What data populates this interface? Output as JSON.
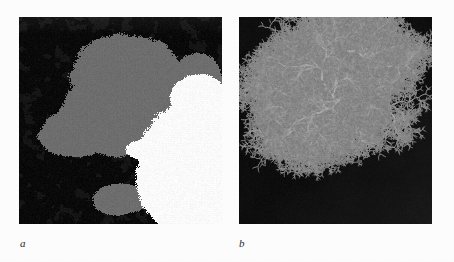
{
  "figure": {
    "type": "two-panel-scientific-figure",
    "background_color": "#fdfdfd",
    "panels": [
      {
        "id": "a",
        "label": "a",
        "name": "percolation-cluster-panel",
        "x": 19,
        "y": 17,
        "width": 203,
        "height": 207,
        "description": "Large irregular percolation / invasion cluster rendered in three tones: black background matrix, mid-grey occupied cluster, white invading region at lower right",
        "colors": {
          "background": "#0a0a0a",
          "cluster": "#6e6e6e",
          "void": "#fbfbfb",
          "dark_noise": "#161616"
        },
        "seed": 20394,
        "grid": 128,
        "occupancy": 0.5,
        "white_region_center": [
          0.82,
          0.72
        ],
        "white_region_radius": 0.34
      },
      {
        "id": "b",
        "label": "b",
        "name": "dla-dendrite-panel",
        "x": 239,
        "y": 17,
        "width": 193,
        "height": 207,
        "description": "Diffusion-limited-aggregation dendritic fractal, light grey branches on a near-black field, cluster occupying the upper-middle of the frame",
        "colors": {
          "background": "#070707",
          "branches": "#9a9a9a",
          "branch_tip": "#b8b8b8",
          "dark_noise": "#121212"
        },
        "seed": 77431,
        "cluster_center": [
          0.52,
          0.4
        ],
        "cluster_extent": 0.46,
        "branch_count": 7,
        "branch_depth": 7,
        "scale_marker": {
          "present": true,
          "x": 0.61,
          "y": 0.69,
          "width_px": 5,
          "height_px": 3,
          "color": "#5a5a5a"
        }
      }
    ]
  },
  "chart_data": {
    "type": "image",
    "title": "",
    "subtitle": "",
    "xlabel": "",
    "ylabel": "",
    "legend": [],
    "annotations": [
      "a",
      "b"
    ],
    "series": [
      {
        "name": "panel-a-percolation-cluster",
        "render": "raster",
        "fractal_dimension": 1.89,
        "phases": [
          "black-matrix",
          "grey-cluster",
          "white-void"
        ]
      },
      {
        "name": "panel-b-dla-aggregate",
        "render": "raster",
        "fractal_dimension": 1.71,
        "phases": [
          "black-field",
          "grey-dendrite"
        ]
      }
    ]
  }
}
